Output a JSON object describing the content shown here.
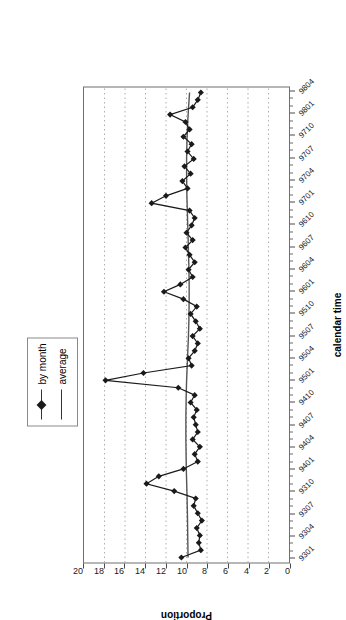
{
  "chart_data": {
    "type": "line",
    "title": "",
    "xlabel": "calendar time",
    "ylabel": "Proportion",
    "ylim": [
      0,
      20
    ],
    "ytick_labels": [
      "0",
      "2",
      "4",
      "6",
      "8",
      "10",
      "12",
      "14",
      "16",
      "18",
      "20"
    ],
    "ytick_values": [
      0,
      2,
      4,
      6,
      8,
      10,
      12,
      14,
      16,
      18,
      20
    ],
    "grid": true,
    "grid_axis": "y",
    "orientation": "rotated-90",
    "legend_position": "top-center",
    "xtick_labels": [
      "9301",
      "9304",
      "9307",
      "9310",
      "9401",
      "9404",
      "9407",
      "9410",
      "9501",
      "9504",
      "9507",
      "9510",
      "9601",
      "9604",
      "9607",
      "9610",
      "9701",
      "9704",
      "9707",
      "9710",
      "9801",
      "9804"
    ],
    "x": [
      "9301",
      "9302",
      "9303",
      "9304",
      "9305",
      "9306",
      "9307",
      "9308",
      "9309",
      "9310",
      "9311",
      "9312",
      "9401",
      "9402",
      "9403",
      "9404",
      "9405",
      "9406",
      "9407",
      "9408",
      "9409",
      "9410",
      "9411",
      "9412",
      "9501",
      "9502",
      "9503",
      "9504",
      "9505",
      "9506",
      "9507",
      "9508",
      "9509",
      "9510",
      "9511",
      "9512",
      "9601",
      "9602",
      "9603",
      "9604",
      "9605",
      "9606",
      "9607",
      "9608",
      "9609",
      "9610",
      "9611",
      "9612",
      "9701",
      "9702",
      "9703",
      "9704",
      "9705",
      "9706",
      "9707",
      "9708",
      "9709",
      "9710",
      "9711",
      "9712",
      "9801",
      "9802",
      "9803",
      "9804"
    ],
    "series": [
      {
        "name": "by month",
        "marker": "diamond",
        "color": "#1a1a1a",
        "values": [
          10.5,
          8.6,
          8.8,
          8.7,
          9.0,
          8.5,
          8.9,
          9.3,
          9.1,
          11.2,
          13.9,
          12.7,
          10.3,
          8.9,
          9.2,
          8.7,
          9.4,
          8.9,
          9.1,
          9.3,
          9.0,
          9.6,
          9.2,
          10.8,
          17.9,
          14.2,
          9.5,
          9.8,
          9.2,
          8.9,
          9.4,
          8.7,
          9.1,
          9.6,
          9.0,
          10.3,
          12.2,
          10.6,
          9.4,
          9.8,
          9.2,
          9.7,
          10.1,
          9.4,
          10.0,
          9.5,
          9.2,
          9.7,
          13.4,
          12.0,
          9.9,
          10.4,
          9.6,
          10.2,
          9.3,
          9.9,
          9.5,
          10.3,
          9.7,
          10.1,
          11.6,
          9.4,
          8.9,
          8.6
        ]
      },
      {
        "name": "average",
        "marker": "none",
        "color": "#555555",
        "values": [
          9.85,
          9.86,
          9.87,
          9.88,
          9.89,
          9.9,
          9.91,
          9.93,
          9.94,
          9.96,
          9.98,
          10.0,
          10.02,
          10.03,
          10.04,
          10.05,
          10.06,
          10.06,
          10.06,
          10.06,
          10.05,
          10.04,
          10.03,
          10.01,
          9.99,
          9.96,
          9.93,
          9.9,
          9.87,
          9.84,
          9.81,
          9.79,
          9.77,
          9.76,
          9.75,
          9.74,
          9.74,
          9.74,
          9.75,
          9.76,
          9.78,
          9.8,
          9.82,
          9.84,
          9.86,
          9.88,
          9.9,
          9.92,
          9.94,
          9.96,
          9.97,
          9.98,
          9.99,
          9.99,
          9.99,
          9.98,
          9.96,
          9.94,
          9.91,
          9.88,
          9.84,
          9.8,
          9.75,
          9.7
        ]
      }
    ]
  },
  "legend": {
    "entries": [
      {
        "label": "by month"
      },
      {
        "label": "average"
      }
    ]
  }
}
